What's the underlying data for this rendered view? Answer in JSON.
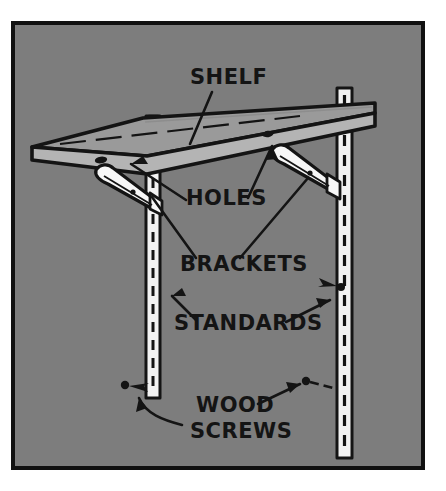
{
  "figure": {
    "type": "technical-line-illustration",
    "background_color": "#7d7d7d",
    "border_color": "#111111",
    "paper_color": "#ffffff",
    "ink_color": "#141414",
    "metal_color": "#f2f2f2",
    "shelf_top_color": "#9a9a9a",
    "shelf_edge_color": "#b4b4b4"
  },
  "labels": [
    {
      "id": "shelf",
      "text": "SHELF",
      "x": 190,
      "y": 84,
      "font_size": 21,
      "points_to": "shelf board top surface"
    },
    {
      "id": "holes",
      "text": "HOLES",
      "x": 186,
      "y": 205,
      "font_size": 21,
      "points_to": "pilot holes in shelf underside"
    },
    {
      "id": "brackets",
      "text": "BRACKETS",
      "x": 180,
      "y": 271,
      "font_size": 21,
      "points_to": "shelf support brackets"
    },
    {
      "id": "standards",
      "text": "STANDARDS",
      "x": 174,
      "y": 330,
      "font_size": 21,
      "points_to": "slotted vertical wall standards"
    },
    {
      "id": "wood-screws-line1",
      "text": "WOOD",
      "x": 196,
      "y": 412,
      "font_size": 21,
      "points_to": "wood screws fastening standards"
    },
    {
      "id": "wood-screws-line2",
      "text": "SCREWS",
      "x": 190,
      "y": 438,
      "font_size": 21,
      "points_to": "wood screws fastening standards"
    }
  ],
  "parts": [
    {
      "id": "shelf-board",
      "name": "shelf",
      "count": 1
    },
    {
      "id": "bracket-left",
      "name": "bracket",
      "count": 1
    },
    {
      "id": "bracket-right",
      "name": "bracket",
      "count": 1
    },
    {
      "id": "standard-left",
      "name": "standard",
      "count": 1
    },
    {
      "id": "standard-right",
      "name": "standard",
      "count": 1
    },
    {
      "id": "hole-left",
      "name": "hole",
      "count": 1
    },
    {
      "id": "hole-right",
      "name": "hole",
      "count": 1
    },
    {
      "id": "screw-lower-left",
      "name": "wood screw",
      "count": 1
    },
    {
      "id": "screw-lower-right",
      "name": "wood screw",
      "count": 1
    },
    {
      "id": "screw-mid-right",
      "name": "wood screw",
      "count": 1
    }
  ]
}
